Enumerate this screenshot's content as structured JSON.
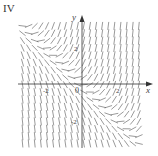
{
  "panel": {
    "label": "IV"
  },
  "axes": {
    "x_label": "x",
    "y_label": "y",
    "origin_label": "0",
    "x_ticks": [
      {
        "value": -2,
        "label": "-2"
      },
      {
        "value": 2,
        "label": "2"
      }
    ],
    "y_ticks": [
      {
        "value": 2,
        "label": "2"
      },
      {
        "value": -2,
        "label": "-2"
      }
    ],
    "xlim": [
      -3.5,
      3.5
    ],
    "ylim": [
      -3.5,
      3.5
    ]
  },
  "colors": {
    "segments": "#555555",
    "axes": "#333333"
  },
  "chart_data": {
    "type": "slope-field",
    "title": "IV",
    "xlabel": "x",
    "ylabel": "y",
    "xlim": [
      -3.5,
      3.5
    ],
    "ylim": [
      -3.5,
      3.5
    ],
    "x_tick_labels": [
      "-2",
      "0",
      "2"
    ],
    "y_tick_labels": [
      "2",
      "-2"
    ],
    "grid": false
  }
}
